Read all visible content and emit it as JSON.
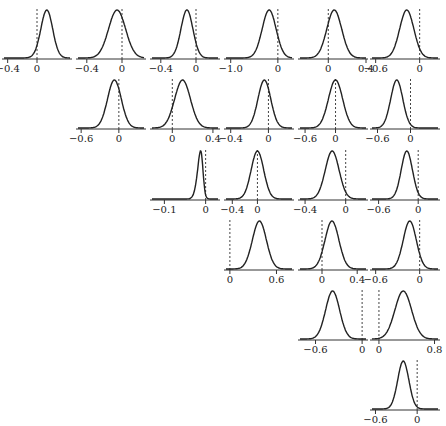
{
  "chart_data": {
    "type": "density-grid",
    "title": "",
    "layout": "upper-triangular 6x6 grid of posterior density plots with dashed reference line at 0",
    "rows": 6,
    "cols": 6,
    "reference_line": 0,
    "panels": [
      {
        "row": 1,
        "col": 1,
        "xlim": [
          -0.45,
          0.45
        ],
        "ticks": [
          -0.4,
          0
        ],
        "tick_labels": [
          "−0.4",
          "0"
        ],
        "mean": 0.17,
        "sd": 0.09,
        "skew": -0.6
      },
      {
        "row": 1,
        "col": 2,
        "xlim": [
          -0.5,
          0.25
        ],
        "ticks": [
          -0.4,
          0
        ],
        "tick_labels": [
          "−0.4",
          "0"
        ],
        "mean": -0.08,
        "sd": 0.1,
        "skew": 0.3
      },
      {
        "row": 1,
        "col": 3,
        "xlim": [
          -0.5,
          0.25
        ],
        "ticks": [
          -0.4,
          0
        ],
        "tick_labels": [
          "−0.4",
          "0"
        ],
        "mean": -0.12,
        "sd": 0.07,
        "skew": 0.3
      },
      {
        "row": 1,
        "col": 4,
        "xlim": [
          -1.1,
          0.3
        ],
        "ticks": [
          -1.0,
          0
        ],
        "tick_labels": [
          "−1.0",
          "0"
        ],
        "mean": -0.16,
        "sd": 0.15,
        "skew": -0.2
      },
      {
        "row": 1,
        "col": 5,
        "xlim": [
          -0.3,
          0.4
        ],
        "ticks": [
          0,
          0.4
        ],
        "tick_labels": [
          "0",
          "0.4"
        ],
        "mean": 0.05,
        "sd": 0.08,
        "skew": 0.2
      },
      {
        "row": 1,
        "col": 6,
        "xlim": [
          -0.65,
          0.25
        ],
        "ticks": [
          -0.6,
          0
        ],
        "tick_labels": [
          "−0.6",
          "0"
        ],
        "mean": -0.2,
        "sd": 0.1,
        "skew": 0.3
      },
      {
        "row": 2,
        "col": 2,
        "xlim": [
          -0.65,
          0.4
        ],
        "ticks": [
          -0.6,
          0
        ],
        "tick_labels": [
          "−0.6",
          "0"
        ],
        "mean": -0.08,
        "sd": 0.11,
        "skew": 0.1
      },
      {
        "row": 2,
        "col": 3,
        "xlim": [
          -0.2,
          0.45
        ],
        "ticks": [
          0,
          0.4
        ],
        "tick_labels": [
          "0",
          "0.4"
        ],
        "mean": 0.12,
        "sd": 0.08,
        "skew": -0.3
      },
      {
        "row": 2,
        "col": 4,
        "xlim": [
          -0.45,
          0.25
        ],
        "ticks": [
          -0.4,
          0
        ],
        "tick_labels": [
          "−0.4",
          "0"
        ],
        "mean": -0.06,
        "sd": 0.07,
        "skew": 0.3
      },
      {
        "row": 2,
        "col": 5,
        "xlim": [
          -0.7,
          0.6
        ],
        "ticks": [
          -0.6,
          0
        ],
        "tick_labels": [
          "−0.6",
          "0"
        ],
        "mean": 0.0,
        "sd": 0.14,
        "skew": 0
      },
      {
        "row": 2,
        "col": 6,
        "xlim": [
          -0.7,
          0.5
        ],
        "ticks": [
          -0.6,
          0
        ],
        "tick_labels": [
          "−0.6",
          "0"
        ],
        "mean": -0.25,
        "sd": 0.11,
        "skew": 0
      },
      {
        "row": 3,
        "col": 3,
        "xlim": [
          -0.13,
          0.03
        ],
        "ticks": [
          -0.1,
          0
        ],
        "tick_labels": [
          "−0.1",
          "0"
        ],
        "mean": -0.007,
        "sd": 0.01,
        "skew": -2.0
      },
      {
        "row": 3,
        "col": 4,
        "xlim": [
          -0.5,
          0.55
        ],
        "ticks": [
          -0.4,
          0
        ],
        "tick_labels": [
          "−0.4",
          "0"
        ],
        "mean": 0.0,
        "sd": 0.1,
        "skew": 0
      },
      {
        "row": 3,
        "col": 5,
        "xlim": [
          -0.45,
          0.2
        ],
        "ticks": [
          -0.4,
          0
        ],
        "tick_labels": [
          "−0.4",
          "0"
        ],
        "mean": -0.15,
        "sd": 0.07,
        "skew": 0.3
      },
      {
        "row": 3,
        "col": 6,
        "xlim": [
          -0.7,
          0.3
        ],
        "ticks": [
          -0.6,
          0
        ],
        "tick_labels": [
          "−0.6",
          "0"
        ],
        "mean": -0.2,
        "sd": 0.09,
        "skew": 0.4
      },
      {
        "row": 4,
        "col": 4,
        "xlim": [
          -0.05,
          0.8
        ],
        "ticks": [
          0,
          0.6
        ],
        "tick_labels": [
          "0",
          "0.6"
        ],
        "mean": 0.38,
        "sd": 0.09,
        "skew": 0
      },
      {
        "row": 4,
        "col": 5,
        "xlim": [
          -0.25,
          0.5
        ],
        "ticks": [
          0,
          0.4
        ],
        "tick_labels": [
          "0",
          "0.4"
        ],
        "mean": 0.1,
        "sd": 0.08,
        "skew": 0.2
      },
      {
        "row": 4,
        "col": 6,
        "xlim": [
          -0.65,
          0.25
        ],
        "ticks": [
          -0.6,
          0
        ],
        "tick_labels": [
          "−0.6",
          "0"
        ],
        "mean": -0.15,
        "sd": 0.09,
        "skew": 0.2
      },
      {
        "row": 5,
        "col": 5,
        "xlim": [
          -0.8,
          0.05
        ],
        "ticks": [
          -0.6,
          0
        ],
        "tick_labels": [
          "−0.6",
          "0"
        ],
        "mean": -0.38,
        "sd": 0.09,
        "skew": 0
      },
      {
        "row": 5,
        "col": 6,
        "xlim": [
          -0.1,
          0.85
        ],
        "ticks": [
          0,
          0.8
        ],
        "tick_labels": [
          "0",
          "0.8"
        ],
        "mean": 0.35,
        "sd": 0.12,
        "skew": 0
      },
      {
        "row": 6,
        "col": 6,
        "xlim": [
          -0.65,
          0.3
        ],
        "ticks": [
          -0.6,
          0
        ],
        "tick_labels": [
          "−0.6",
          "0"
        ],
        "mean": -0.2,
        "sd": 0.08,
        "skew": 0
      }
    ],
    "grid": false,
    "legend": null
  },
  "style": {
    "curve_color": "#222222",
    "axis_color": "#333333",
    "reference_color": "#444444"
  }
}
